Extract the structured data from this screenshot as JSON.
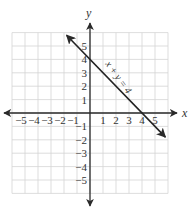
{
  "chart_data": {
    "type": "line",
    "title": "",
    "xlabel": "x",
    "ylabel": "y",
    "xlim": [
      -6,
      6
    ],
    "ylim": [
      -6,
      6
    ],
    "grid": true,
    "x_ticks": [
      -5,
      -4,
      -3,
      -2,
      -1,
      1,
      2,
      3,
      4,
      5
    ],
    "y_ticks": [
      -5,
      -4,
      -3,
      -2,
      -1,
      1,
      2,
      3,
      4,
      5
    ],
    "x_tick_labels": [
      "−5",
      "−4",
      "−3",
      "−2",
      "−1",
      "1",
      "2",
      "3",
      "4",
      "5"
    ],
    "y_tick_labels": [
      "−5",
      "−4",
      "−3",
      "−2",
      "−1",
      "1",
      "2",
      "3",
      "4",
      "5"
    ],
    "series": [
      {
        "name": "x + y = 4",
        "equation": "x + y = 4",
        "x": [
          -1.8,
          0,
          4,
          5.8
        ],
        "y": [
          5.8,
          4,
          0,
          -1.8
        ],
        "color": "#222222",
        "arrows": "both"
      }
    ],
    "annotations": [
      {
        "text": "x + y = 4",
        "position": "along line, upper right of y-intercept"
      }
    ],
    "intercepts": {
      "x_intercept": [
        4,
        0
      ],
      "y_intercept": [
        0,
        4
      ]
    }
  },
  "colors": {
    "grid": "#d4d4d4",
    "axis": "#2a2a2a",
    "line": "#222222",
    "text": "#333333"
  }
}
